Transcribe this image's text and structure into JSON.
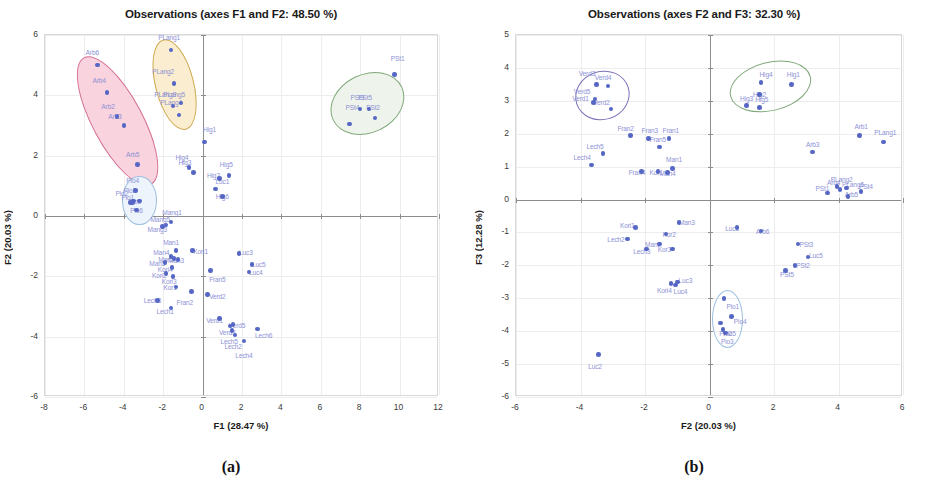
{
  "figure": {
    "caption_a": "(a)",
    "caption_b": "(b)"
  },
  "chart_data": [
    {
      "panel": "a",
      "type": "scatter",
      "title": "Observations (axes F1 and F2: 48.50 %)",
      "xlabel": "F1 (28.47 %)",
      "ylabel": "F2 (20.03 %)",
      "xlim": [
        -8,
        12
      ],
      "ylim": [
        -6,
        6
      ],
      "xticks": [
        -8,
        -6,
        -4,
        -2,
        0,
        2,
        4,
        6,
        8,
        10,
        12
      ],
      "yticks": [
        -6,
        -4,
        -2,
        0,
        2,
        4,
        6
      ],
      "grid": true,
      "legend": "none",
      "point_color": "#5566c4",
      "label_color": "#8e92d6",
      "clusters": [
        {
          "name": "Arb",
          "fill": "#f9d3dd",
          "stroke": "#d46b91",
          "cx": -4.35,
          "cy": 3.2,
          "rx": 1.25,
          "ry": 2.35,
          "rot": -28
        },
        {
          "name": "PLang",
          "fill": "#fbedcf",
          "stroke": "#cda94e",
          "cx": -1.45,
          "cy": 4.4,
          "rx": 0.95,
          "ry": 1.5,
          "rot": -14
        },
        {
          "name": "Pio",
          "fill": "#eef4fc",
          "stroke": "#9dbfe0",
          "cx": -3.25,
          "cy": 0.55,
          "rx": 0.82,
          "ry": 0.78,
          "rot": 0
        },
        {
          "name": "PSt",
          "fill": "#eef4ec",
          "stroke": "#7fa878",
          "cx": 8.3,
          "cy": 3.75,
          "rx": 1.9,
          "ry": 0.95,
          "rot": -26
        }
      ],
      "points": [
        {
          "label": "Arb6",
          "x": -5.35,
          "y": 5.0,
          "lx": -5.6,
          "ly": 5.45
        },
        {
          "label": "Arb4",
          "x": -4.85,
          "y": 4.1,
          "lx": -5.25,
          "ly": 4.5
        },
        {
          "label": "Arb2",
          "x": -4.35,
          "y": 3.3,
          "lx": -4.8,
          "ly": 3.65
        },
        {
          "label": "Arb3",
          "x": -4.0,
          "y": 3.0,
          "lx": -4.45,
          "ly": 3.3
        },
        {
          "label": "Arb5",
          "x": -3.3,
          "y": 1.7,
          "lx": -3.55,
          "ly": 2.05
        },
        {
          "label": "PLang1",
          "x": -1.6,
          "y": 5.5,
          "lx": -1.7,
          "ly": 5.95
        },
        {
          "label": "PLang2",
          "x": -1.45,
          "y": 4.4,
          "lx": -2.0,
          "ly": 4.8
        },
        {
          "label": "PLang5",
          "x": -1.1,
          "y": 3.75,
          "lx": -1.45,
          "ly": 4.05
        },
        {
          "label": "PLang3",
          "x": -1.5,
          "y": 3.65,
          "lx": -1.9,
          "ly": 4.05
        },
        {
          "label": "PLang4",
          "x": -1.2,
          "y": 3.35,
          "lx": -1.6,
          "ly": 3.78
        },
        {
          "label": "Pio4",
          "x": -3.4,
          "y": 0.85,
          "lx": -3.55,
          "ly": 1.2
        },
        {
          "label": "Pio3",
          "x": -3.5,
          "y": 0.5,
          "lx": -3.7,
          "ly": 0.85
        },
        {
          "label": "Pio2",
          "x": -3.65,
          "y": 0.45,
          "lx": -4.1,
          "ly": 0.75
        },
        {
          "label": "Pio1",
          "x": -3.55,
          "y": 0.45,
          "lx": -3.8,
          "ly": 0.62
        },
        {
          "label": "Pio5",
          "x": -3.2,
          "y": 0.5,
          "lx": -3.45,
          "ly": 0.5
        },
        {
          "label": "Pio6",
          "x": -3.35,
          "y": 0.2,
          "lx": -3.35,
          "ly": 0.2
        },
        {
          "label": "Hig1",
          "x": 0.1,
          "y": 2.45,
          "lx": 0.35,
          "ly": 2.9
        },
        {
          "label": "Hig4",
          "x": -0.7,
          "y": 1.6,
          "lx": -1.05,
          "ly": 1.95
        },
        {
          "label": "Hig3",
          "x": -0.45,
          "y": 1.45,
          "lx": -0.9,
          "ly": 1.78
        },
        {
          "label": "Hig5",
          "x": 1.35,
          "y": 1.35,
          "lx": 1.2,
          "ly": 1.72
        },
        {
          "label": "Hig2",
          "x": 0.85,
          "y": 1.25,
          "lx": 0.55,
          "ly": 1.35
        },
        {
          "label": "Luc1",
          "x": 0.65,
          "y": 0.9,
          "lx": 1.0,
          "ly": 1.15
        },
        {
          "label": "Hig6",
          "x": 1.0,
          "y": 0.65,
          "lx": 1.0,
          "ly": 0.65
        },
        {
          "label": "PSt1",
          "x": 9.75,
          "y": 4.7,
          "lx": 9.9,
          "ly": 5.25
        },
        {
          "label": "PSt3",
          "x": 8.0,
          "y": 3.55,
          "lx": 7.85,
          "ly": 3.95
        },
        {
          "label": "PSt5",
          "x": 8.45,
          "y": 3.55,
          "lx": 8.25,
          "ly": 3.95
        },
        {
          "label": "PSt2",
          "x": 8.75,
          "y": 3.25,
          "lx": 8.65,
          "ly": 3.6
        },
        {
          "label": "PSt4",
          "x": 7.45,
          "y": 3.05,
          "lx": 7.6,
          "ly": 3.62
        },
        {
          "label": "Mang1",
          "x": -1.6,
          "y": -0.2,
          "lx": -1.55,
          "ly": 0.12
        },
        {
          "label": "Mang5",
          "x": -1.85,
          "y": -0.3,
          "lx": -2.15,
          "ly": -0.1
        },
        {
          "label": "Mang3",
          "x": -2.05,
          "y": -0.35,
          "lx": -2.3,
          "ly": -0.42
        },
        {
          "label": "Man1",
          "x": -1.35,
          "y": -1.15,
          "lx": -1.6,
          "ly": -0.85
        },
        {
          "label": "Man4",
          "x": -1.6,
          "y": -1.35,
          "lx": -2.1,
          "ly": -1.2
        },
        {
          "label": "Man2",
          "x": -1.45,
          "y": -1.4,
          "lx": -1.85,
          "ly": -1.42
        },
        {
          "label": "Man3",
          "x": -1.25,
          "y": -1.45,
          "lx": -1.35,
          "ly": -1.45
        },
        {
          "label": "Man5",
          "x": -1.9,
          "y": -1.55,
          "lx": -2.3,
          "ly": -1.55
        },
        {
          "label": "Kori4",
          "x": -1.55,
          "y": -1.7,
          "lx": -1.9,
          "ly": -1.75
        },
        {
          "label": "Kori2",
          "x": -1.85,
          "y": -1.9,
          "lx": -2.2,
          "ly": -1.95
        },
        {
          "label": "Kori3",
          "x": -1.5,
          "y": -2.0,
          "lx": -1.7,
          "ly": -2.15
        },
        {
          "label": "Kori1",
          "x": -0.5,
          "y": -1.15,
          "lx": -0.1,
          "ly": -1.15
        },
        {
          "label": "Luc3",
          "x": 1.85,
          "y": -1.25,
          "lx": 2.2,
          "ly": -1.2
        },
        {
          "label": "Luc5",
          "x": 2.5,
          "y": -1.6,
          "lx": 2.85,
          "ly": -1.6
        },
        {
          "label": "Luc4",
          "x": 2.35,
          "y": -1.85,
          "lx": 2.7,
          "ly": -1.85
        },
        {
          "label": "Fran5",
          "x": 0.4,
          "y": -1.8,
          "lx": 0.75,
          "ly": -2.1
        },
        {
          "label": "Kor1",
          "x": -1.35,
          "y": -2.35,
          "lx": -1.65,
          "ly": -2.35
        },
        {
          "label": "Fran2",
          "x": -0.55,
          "y": -2.5,
          "lx": -0.9,
          "ly": -2.85
        },
        {
          "label": "Verd2",
          "x": 0.25,
          "y": -2.6,
          "lx": 0.75,
          "ly": -2.65
        },
        {
          "label": "Lech3",
          "x": -2.3,
          "y": -2.8,
          "lx": -2.55,
          "ly": -2.8
        },
        {
          "label": "Lech1",
          "x": -1.6,
          "y": -3.05,
          "lx": -1.9,
          "ly": -3.15
        },
        {
          "label": "Verd1",
          "x": 0.85,
          "y": -3.4,
          "lx": 0.6,
          "ly": -3.45
        },
        {
          "label": "Verd3",
          "x": 1.4,
          "y": -3.65,
          "lx": 1.25,
          "ly": -3.85
        },
        {
          "label": "Verd5",
          "x": 1.55,
          "y": -3.6,
          "lx": 1.75,
          "ly": -3.6
        },
        {
          "label": "Lech5",
          "x": 1.5,
          "y": -3.8,
          "lx": 1.35,
          "ly": -4.15
        },
        {
          "label": "Lech2",
          "x": 1.65,
          "y": -3.95,
          "lx": 1.55,
          "ly": -4.3
        },
        {
          "label": "Lech4",
          "x": 2.1,
          "y": -4.15,
          "lx": 2.1,
          "ly": -4.6
        },
        {
          "label": "Lech6",
          "x": 2.8,
          "y": -3.75,
          "lx": 3.1,
          "ly": -3.95
        }
      ]
    },
    {
      "panel": "b",
      "type": "scatter",
      "title": "Observations (axes F2 and F3: 32.30 %)",
      "xlabel": "F2 (20.03 %)",
      "ylabel": "F3 (12.28 %)",
      "xlim": [
        -6,
        6
      ],
      "ylim": [
        -6,
        5
      ],
      "xticks": [
        -6,
        -4,
        -2,
        0,
        2,
        4,
        6
      ],
      "yticks": [
        -6,
        -5,
        -4,
        -3,
        -2,
        -1,
        0,
        1,
        2,
        3,
        4,
        5
      ],
      "grid": true,
      "legend": "none",
      "point_color": "#5566c4",
      "label_color": "#8e92d6",
      "clusters": [
        {
          "name": "Verd",
          "fill": "none",
          "stroke": "#7d6fb8",
          "cx": -3.35,
          "cy": 3.2,
          "rx": 0.82,
          "ry": 0.72,
          "rot": -18
        },
        {
          "name": "Hig",
          "fill": "none",
          "stroke": "#7fa878",
          "cx": 1.85,
          "cy": 3.45,
          "rx": 1.25,
          "ry": 0.72,
          "rot": -14
        },
        {
          "name": "Pio",
          "fill": "none",
          "stroke": "#9dbfe0",
          "cx": 0.52,
          "cy": -3.6,
          "rx": 0.45,
          "ry": 0.85,
          "rot": 0
        }
      ],
      "points": [
        {
          "label": "Verd3",
          "x": -3.5,
          "y": 3.5,
          "lx": -3.8,
          "ly": 3.85
        },
        {
          "label": "Verd4",
          "x": -3.15,
          "y": 3.45,
          "lx": -3.3,
          "ly": 3.72
        },
        {
          "label": "Verd5",
          "x": -3.55,
          "y": 3.05,
          "lx": -3.95,
          "ly": 3.3
        },
        {
          "label": "Verd1",
          "x": -3.6,
          "y": 2.95,
          "lx": -4.0,
          "ly": 3.08
        },
        {
          "label": "Verd2",
          "x": -3.05,
          "y": 2.75,
          "lx": -3.35,
          "ly": 2.95
        },
        {
          "label": "Hig4",
          "x": 1.6,
          "y": 3.55,
          "lx": 1.75,
          "ly": 3.8
        },
        {
          "label": "Hig1",
          "x": 2.55,
          "y": 3.5,
          "lx": 2.6,
          "ly": 3.82
        },
        {
          "label": "Hig2",
          "x": 1.55,
          "y": 3.2,
          "lx": 1.55,
          "ly": 3.2
        },
        {
          "label": "Hig3",
          "x": 1.15,
          "y": 2.85,
          "lx": 1.15,
          "ly": 3.08
        },
        {
          "label": "Hig5",
          "x": 1.55,
          "y": 2.8,
          "lx": 1.62,
          "ly": 3.05
        },
        {
          "label": "Fran2",
          "x": -2.45,
          "y": 1.95,
          "lx": -2.6,
          "ly": 2.18
        },
        {
          "label": "Fran3",
          "x": -1.9,
          "y": 1.85,
          "lx": -1.85,
          "ly": 2.1
        },
        {
          "label": "Fran1",
          "x": -1.25,
          "y": 1.85,
          "lx": -1.2,
          "ly": 2.12
        },
        {
          "label": "Fran5",
          "x": -1.55,
          "y": 1.6,
          "lx": -1.6,
          "ly": 1.85
        },
        {
          "label": "Lech5",
          "x": -3.3,
          "y": 1.4,
          "lx": -3.55,
          "ly": 1.62
        },
        {
          "label": "Lech4",
          "x": -3.65,
          "y": 1.05,
          "lx": -3.95,
          "ly": 1.3
        },
        {
          "label": "Fran4",
          "x": -2.1,
          "y": 0.85,
          "lx": -2.25,
          "ly": 0.85
        },
        {
          "label": "Kor1",
          "x": -1.6,
          "y": 0.85,
          "lx": -1.65,
          "ly": 0.85
        },
        {
          "label": "Man1",
          "x": -1.15,
          "y": 0.95,
          "lx": -1.1,
          "ly": 1.22
        },
        {
          "label": "Man4",
          "x": -1.3,
          "y": 0.82,
          "lx": -1.3,
          "ly": 0.82
        },
        {
          "label": "Arb1",
          "x": 4.65,
          "y": 1.95,
          "lx": 4.7,
          "ly": 2.25
        },
        {
          "label": "PLang1",
          "x": 5.4,
          "y": 1.75,
          "lx": 5.45,
          "ly": 2.05
        },
        {
          "label": "Arb3",
          "x": 3.2,
          "y": 1.45,
          "lx": 3.2,
          "ly": 1.7
        },
        {
          "label": "PLang2",
          "x": 3.95,
          "y": 0.4,
          "lx": 4.1,
          "ly": 0.62
        },
        {
          "label": "PLang5",
          "x": 4.25,
          "y": 0.35,
          "lx": 4.45,
          "ly": 0.48
        },
        {
          "label": "Arb4",
          "x": 4.05,
          "y": 0.3,
          "lx": 3.85,
          "ly": 0.52
        },
        {
          "label": "PSt4",
          "x": 4.7,
          "y": 0.25,
          "lx": 4.85,
          "ly": 0.4
        },
        {
          "label": "PSt1",
          "x": 3.65,
          "y": 0.2,
          "lx": 3.5,
          "ly": 0.35
        },
        {
          "label": "Arb5",
          "x": 4.3,
          "y": 0.1,
          "lx": 4.4,
          "ly": 0.18
        },
        {
          "label": "Man3",
          "x": -0.95,
          "y": -0.7,
          "lx": -0.7,
          "ly": -0.68
        },
        {
          "label": "Luc1",
          "x": 0.85,
          "y": -0.85,
          "lx": 0.7,
          "ly": -0.85
        },
        {
          "label": "Kori1",
          "x": -2.3,
          "y": -0.85,
          "lx": -2.55,
          "ly": -0.78
        },
        {
          "label": "Arb6",
          "x": 1.6,
          "y": -0.95,
          "lx": 1.65,
          "ly": -0.95
        },
        {
          "label": "Kor2",
          "x": -1.35,
          "y": -1.05,
          "lx": -1.25,
          "ly": -1.05
        },
        {
          "label": "Lech2",
          "x": -2.55,
          "y": -1.2,
          "lx": -2.9,
          "ly": -1.2
        },
        {
          "label": "Man2",
          "x": -1.55,
          "y": -1.35,
          "lx": -1.75,
          "ly": -1.35
        },
        {
          "label": "PSt3",
          "x": 2.75,
          "y": -1.35,
          "lx": 3.0,
          "ly": -1.35
        },
        {
          "label": "Kor3",
          "x": -1.15,
          "y": -1.5,
          "lx": -1.4,
          "ly": -1.5
        },
        {
          "label": "Lech3",
          "x": -1.95,
          "y": -1.5,
          "lx": -2.1,
          "ly": -1.55
        },
        {
          "label": "Luc5",
          "x": 3.05,
          "y": -1.75,
          "lx": 3.3,
          "ly": -1.68
        },
        {
          "label": "PSt2",
          "x": 2.65,
          "y": -2.0,
          "lx": 2.9,
          "ly": -2.0
        },
        {
          "label": "PSt5",
          "x": 2.35,
          "y": -2.15,
          "lx": 2.4,
          "ly": -2.25
        },
        {
          "label": "Luc3",
          "x": -1.0,
          "y": -2.5,
          "lx": -0.75,
          "ly": -2.45
        },
        {
          "label": "Kori4",
          "x": -1.2,
          "y": -2.55,
          "lx": -1.4,
          "ly": -2.75
        },
        {
          "label": "Luc4",
          "x": -1.05,
          "y": -2.6,
          "lx": -0.9,
          "ly": -2.78
        },
        {
          "label": "Pio1",
          "x": 0.45,
          "y": -3.0,
          "lx": 0.72,
          "ly": -3.22
        },
        {
          "label": "Pio4",
          "x": 0.68,
          "y": -3.55,
          "lx": 0.95,
          "ly": -3.7
        },
        {
          "label": "Pio5",
          "x": 0.35,
          "y": -3.75,
          "lx": 0.62,
          "ly": -4.05
        },
        {
          "label": "Pio3",
          "x": 0.42,
          "y": -3.95,
          "lx": 0.55,
          "ly": -4.3
        },
        {
          "label": "Pio2",
          "x": 0.5,
          "y": -4.05,
          "lx": 0.5,
          "ly": -4.05
        },
        {
          "label": "Luc2",
          "x": -3.45,
          "y": -4.7,
          "lx": -3.55,
          "ly": -5.05
        }
      ]
    }
  ]
}
